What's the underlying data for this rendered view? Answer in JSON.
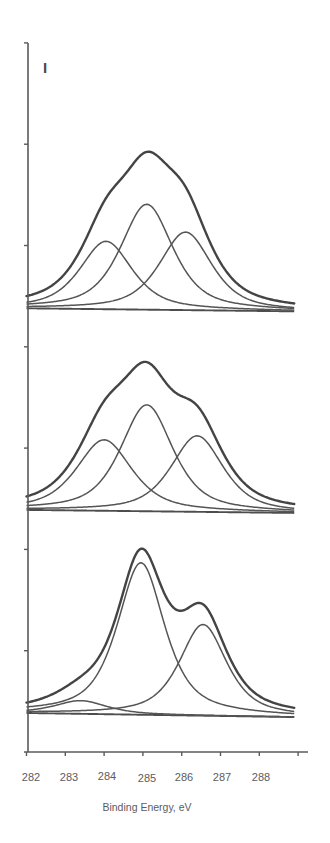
{
  "chart_data": {
    "type": "line",
    "title": "",
    "panel_label": "I",
    "xlabel": "Binding Energy, eV",
    "ylabel": "",
    "xlim": [
      282,
      288.9
    ],
    "ylim": [
      0,
      7
    ],
    "x_ticks": [
      282,
      283,
      284,
      285,
      286,
      287,
      288,
      289
    ],
    "x_tick_labels": [
      "282",
      "283",
      "284",
      "285",
      "286",
      "287",
      "288"
    ],
    "y_ticks": [
      0,
      1,
      2,
      3,
      4,
      5,
      6,
      7
    ],
    "y_tick_labels_visible": false,
    "grid": false,
    "legend": null,
    "line_shape": "pseudo-voigt",
    "panels": [
      {
        "name": "top",
        "background": {
          "start": [
            282,
            4.38
          ],
          "end": [
            288.9,
            4.35
          ]
        },
        "components": [
          {
            "center_eV": 284.05,
            "height": 0.67,
            "fwhm_eV": 1.6,
            "eta": 0.65
          },
          {
            "center_eV": 285.1,
            "height": 1.04,
            "fwhm_eV": 1.6,
            "eta": 0.65
          },
          {
            "center_eV": 286.1,
            "height": 0.77,
            "fwhm_eV": 1.6,
            "eta": 0.65
          }
        ],
        "envelope_peak": {
          "x_eV": 285.1,
          "intensity": 6.03
        }
      },
      {
        "name": "middle",
        "background": {
          "start": [
            282,
            2.39
          ],
          "end": [
            288.9,
            2.36
          ]
        },
        "components": [
          {
            "center_eV": 284.0,
            "height": 0.7,
            "fwhm_eV": 1.7,
            "eta": 0.65
          },
          {
            "center_eV": 285.1,
            "height": 1.05,
            "fwhm_eV": 1.6,
            "eta": 0.65
          },
          {
            "center_eV": 286.4,
            "height": 0.75,
            "fwhm_eV": 1.6,
            "eta": 0.65
          }
        ],
        "envelope_peak": {
          "x_eV": 285.0,
          "intensity": 3.93
        }
      },
      {
        "name": "bottom",
        "background": {
          "start": [
            282,
            0.385
          ],
          "end": [
            288.9,
            0.345
          ]
        },
        "components": [
          {
            "center_eV": 283.4,
            "height": 0.13,
            "fwhm_eV": 1.6,
            "eta": 0.7
          },
          {
            "center_eV": 284.95,
            "height": 1.5,
            "fwhm_eV": 1.45,
            "eta": 0.7
          },
          {
            "center_eV": 286.55,
            "height": 0.9,
            "fwhm_eV": 1.45,
            "eta": 0.7
          }
        ],
        "envelope_peak": {
          "x_eV": 285.0,
          "intensity": 2.06
        }
      }
    ]
  },
  "colors": {
    "envelope": "#444444",
    "component": "#555555",
    "axis": "#5a5a5a",
    "text": "#5c5c5c"
  }
}
